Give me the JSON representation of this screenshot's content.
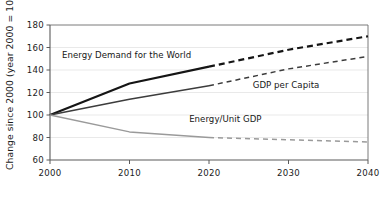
{
  "chart_data": {
    "type": "line",
    "title": "",
    "xlabel": "",
    "ylabel": "Change since 2000 (year 2000 = 100)",
    "xlim": [
      2000,
      2040
    ],
    "ylim": [
      60,
      180
    ],
    "grid": true,
    "legend_position": "inline-annotations",
    "x_ticks": [
      "2000",
      "2010",
      "2020",
      "2030",
      "2040"
    ],
    "y_ticks": [
      "60",
      "80",
      "100",
      "120",
      "140",
      "160",
      "180"
    ],
    "x": [
      2000,
      2010,
      2020,
      2030,
      2040
    ],
    "series": [
      {
        "name": "Energy Demand for the World",
        "values": [
          100,
          128,
          143,
          158,
          170
        ],
        "color": "#151515",
        "width": 2.2,
        "solid_until": 2020,
        "label_x": 2001.5,
        "label_y": 151
      },
      {
        "name": "GDP per Capita",
        "values": [
          100,
          114,
          126,
          141,
          152
        ],
        "color": "#3c3c3c",
        "width": 1.5,
        "solid_until": 2020,
        "label_x": 2025.5,
        "label_y": 124
      },
      {
        "name": "Energy/Unit GDP",
        "values": [
          100,
          85,
          80,
          78,
          76
        ],
        "color": "#9a9a9a",
        "width": 1.5,
        "solid_until": 2020,
        "label_x": 2017.5,
        "label_y": 94
      }
    ]
  },
  "axis": {
    "y_axis_label": "Change since 2000 (year 2000 = 100)",
    "y_tick_labels": [
      "180",
      "160",
      "140",
      "120",
      "100",
      "80",
      "60"
    ],
    "x_tick_labels": [
      "2000",
      "2010",
      "2020",
      "2030",
      "2040"
    ]
  },
  "annotations": [
    {
      "text": "Energy Demand for the World"
    },
    {
      "text": "GDP per Capita"
    },
    {
      "text": "Energy/Unit GDP"
    }
  ],
  "colors": {
    "energy_demand": "#151515",
    "gdp_per_capita": "#3c3c3c",
    "energy_per_unit_gdp": "#9a9a9a",
    "grid": "#e3e3e3",
    "axis": "#5a5a5a",
    "background": "#ffffff"
  }
}
